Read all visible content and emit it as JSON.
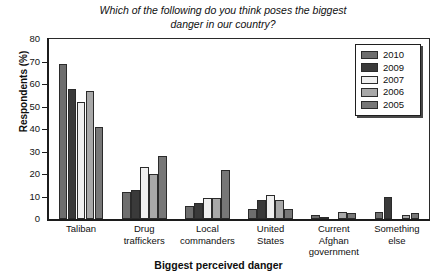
{
  "chart_data": {
    "type": "bar",
    "title": "Which of the following do you think poses the biggest danger in our country?",
    "title_line1": "Which of the following do you think poses the biggest",
    "title_line2": "danger in our country?",
    "xlabel": "Biggest perceived danger",
    "ylabel": "Respondents (%)",
    "ylim": [
      0,
      80
    ],
    "yticks": [
      0,
      10,
      20,
      30,
      40,
      50,
      60,
      70,
      80
    ],
    "grid": false,
    "legend_position": "top-right",
    "categories": [
      "Taliban",
      "Drug traffickers",
      "Local commanders",
      "United States",
      "Current Afghan government",
      "Something else"
    ],
    "category_lines": [
      [
        "Taliban"
      ],
      [
        "Drug",
        "traffickers"
      ],
      [
        "Local",
        "commanders"
      ],
      [
        "United",
        "States"
      ],
      [
        "Current",
        "Afghan",
        "government"
      ],
      [
        "Something",
        "else"
      ]
    ],
    "series": [
      {
        "name": "2010",
        "color": "#6e6e6e",
        "values": [
          69,
          12,
          6,
          4.5,
          2,
          3
        ]
      },
      {
        "name": "2009",
        "color": "#3a3a3a",
        "values": [
          58,
          13,
          7,
          8.5,
          0.5,
          10
        ]
      },
      {
        "name": "2007",
        "color": "#f0f0f0",
        "values": [
          52,
          23,
          9.5,
          10.5,
          0,
          0
        ]
      },
      {
        "name": "2006",
        "color": "#a8a8a8",
        "values": [
          57,
          20,
          9.5,
          8.5,
          3,
          2
        ]
      },
      {
        "name": "2005",
        "color": "#777777",
        "values": [
          41,
          28,
          22,
          4.5,
          2.5,
          2.5
        ]
      }
    ]
  }
}
